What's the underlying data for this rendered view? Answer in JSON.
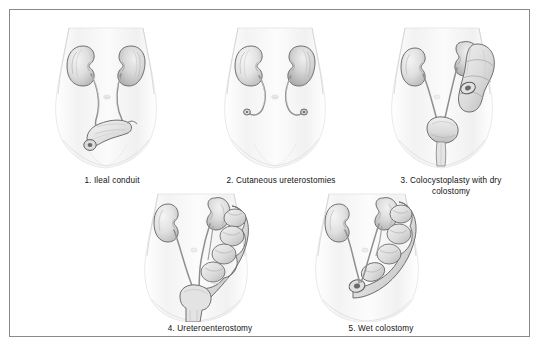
{
  "figure": {
    "background_color": "#ffffff",
    "border_color": "#8a8a8a",
    "organ_fill": "#e8e8e8",
    "organ_outline": "#6e6e6e",
    "body_tint": "#f4f4f4",
    "caption_color": "#111111"
  },
  "panels": [
    {
      "number": "1.",
      "caption": "1.  Ileal conduit",
      "art_name": "ileal-conduit-illustration",
      "organs": [
        "left-kidney",
        "right-kidney",
        "left-ureter",
        "right-ureter",
        "ileal-conduit",
        "stoma",
        "torso-silhouette",
        "navel"
      ]
    },
    {
      "number": "2.",
      "caption": "2.  Cutaneous ureterostomies",
      "art_name": "cutaneous-ureterostomies-illustration",
      "organs": [
        "left-kidney",
        "right-kidney",
        "left-ureter",
        "right-ureter",
        "left-stoma",
        "right-stoma",
        "torso-silhouette",
        "navel"
      ]
    },
    {
      "number": "3.",
      "caption": "3.  Colocystoplasty with dry\ncolostomy",
      "art_name": "colocystoplasty-dry-colostomy-illustration",
      "organs": [
        "left-kidney",
        "right-kidney",
        "left-ureter",
        "right-ureter",
        "colon-segment",
        "colostomy-stoma",
        "bladder",
        "urethra",
        "torso-silhouette",
        "navel"
      ]
    },
    {
      "number": "4.",
      "caption": "4.  Ureteroenterostomy",
      "art_name": "ureteroenterostomy-illustration",
      "organs": [
        "left-kidney",
        "right-kidney",
        "left-ureter",
        "right-ureter",
        "bowel-segment",
        "rectum",
        "torso-silhouette",
        "navel"
      ]
    },
    {
      "number": "5.",
      "caption": "5.  Wet colostomy",
      "art_name": "wet-colostomy-illustration",
      "organs": [
        "left-kidney",
        "right-kidney",
        "left-ureter",
        "right-ureter",
        "colon-segment",
        "wet-stoma",
        "torso-silhouette",
        "navel"
      ]
    }
  ]
}
